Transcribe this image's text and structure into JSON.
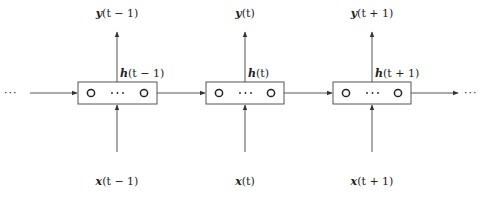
{
  "diagram": {
    "type": "unrolled-recurrent-neural-network",
    "colors": {
      "stroke": "#555555",
      "text": "#222222",
      "background": "#ffffff"
    },
    "left_ellipsis": "···",
    "right_ellipsis": "···",
    "cells": [
      {
        "output": {
          "var": "y",
          "arg": "(t − 1)"
        },
        "hidden": {
          "var": "h",
          "arg": "(t − 1)"
        },
        "input": {
          "var": "x",
          "arg": "(t − 1)"
        },
        "units": [
          "O",
          "···",
          "O"
        ]
      },
      {
        "output": {
          "var": "y",
          "arg": "(t)"
        },
        "hidden": {
          "var": "h",
          "arg": "(t)"
        },
        "input": {
          "var": "x",
          "arg": "(t)"
        },
        "units": [
          "O",
          "···",
          "O"
        ]
      },
      {
        "output": {
          "var": "y",
          "arg": "(t + 1)"
        },
        "hidden": {
          "var": "h",
          "arg": "(t + 1)"
        },
        "input": {
          "var": "x",
          "arg": "(t + 1)"
        },
        "units": [
          "O",
          "···",
          "O"
        ]
      }
    ]
  }
}
